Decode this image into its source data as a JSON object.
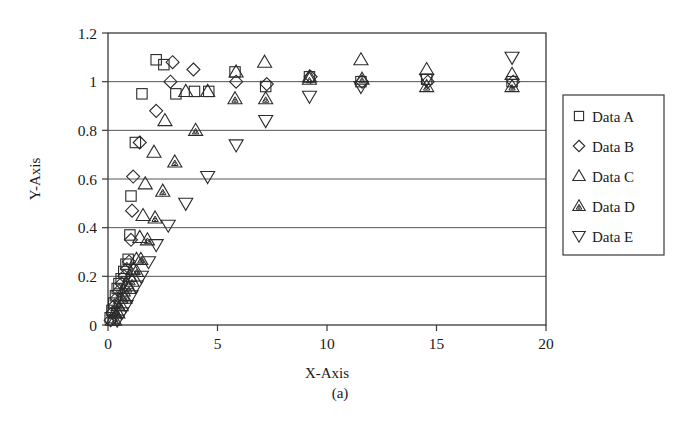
{
  "figure": {
    "caption": "(a)",
    "background_color": "#ffffff",
    "ink_color": "#2b2b2b"
  },
  "chart_data": {
    "type": "scatter",
    "title": "",
    "subtitle": "",
    "xlabel": "X-Axis",
    "ylabel": "Y-Axis",
    "xlim": [
      0,
      20
    ],
    "ylim": [
      0,
      1.2
    ],
    "xticks": [
      0,
      5,
      10,
      15,
      20
    ],
    "xtick_labels": [
      "0",
      "5",
      "10",
      "15",
      "20"
    ],
    "yticks": [
      0,
      0.2,
      0.4,
      0.6,
      0.8,
      1,
      1.2
    ],
    "ytick_labels": [
      "0",
      "0.2",
      "0.4",
      "0.6",
      "0.8",
      "1",
      "1.2"
    ],
    "grid": "horizontal",
    "legend_position": "right-outside",
    "legend_entries": [
      {
        "label": "Data A",
        "marker": "square"
      },
      {
        "label": "Data B",
        "marker": "diamond"
      },
      {
        "label": "Data C",
        "marker": "triangle-up"
      },
      {
        "label": "Data D",
        "marker": "triangle-up-hatched"
      },
      {
        "label": "Data E",
        "marker": "triangle-down"
      }
    ],
    "series": [
      {
        "name": "Data A",
        "marker": "square",
        "points": [
          [
            0.1,
            0.03
          ],
          [
            0.18,
            0.06
          ],
          [
            0.26,
            0.09
          ],
          [
            0.34,
            0.12
          ],
          [
            0.42,
            0.15
          ],
          [
            0.5,
            0.17
          ],
          [
            0.6,
            0.19
          ],
          [
            0.72,
            0.22
          ],
          [
            0.82,
            0.25
          ],
          [
            0.92,
            0.27
          ],
          [
            1.0,
            0.37
          ],
          [
            1.05,
            0.53
          ],
          [
            1.25,
            0.75
          ],
          [
            1.55,
            0.95
          ],
          [
            2.2,
            1.09
          ],
          [
            2.55,
            1.07
          ],
          [
            3.1,
            0.95
          ],
          [
            3.95,
            0.96
          ],
          [
            4.6,
            0.96
          ],
          [
            5.8,
            1.04
          ],
          [
            7.2,
            0.98
          ],
          [
            9.2,
            1.02
          ],
          [
            11.55,
            1.0
          ],
          [
            14.55,
            1.01
          ],
          [
            18.45,
            1.0
          ]
        ]
      },
      {
        "name": "Data B",
        "marker": "diamond",
        "points": [
          [
            0.12,
            0.02
          ],
          [
            0.2,
            0.05
          ],
          [
            0.3,
            0.08
          ],
          [
            0.4,
            0.11
          ],
          [
            0.5,
            0.14
          ],
          [
            0.62,
            0.17
          ],
          [
            0.74,
            0.2
          ],
          [
            0.86,
            0.23
          ],
          [
            0.96,
            0.26
          ],
          [
            1.05,
            0.35
          ],
          [
            1.1,
            0.47
          ],
          [
            1.15,
            0.61
          ],
          [
            1.45,
            0.75
          ],
          [
            2.2,
            0.88
          ],
          [
            2.85,
            1.0
          ],
          [
            2.95,
            1.08
          ],
          [
            3.9,
            1.05
          ],
          [
            5.85,
            1.0
          ],
          [
            7.25,
            0.99
          ],
          [
            9.25,
            1.02
          ],
          [
            11.6,
            1.0
          ],
          [
            14.6,
            1.0
          ],
          [
            18.5,
            1.0
          ]
        ]
      },
      {
        "name": "Data C",
        "marker": "triangle-up",
        "points": [
          [
            0.2,
            0.02
          ],
          [
            0.32,
            0.05
          ],
          [
            0.45,
            0.08
          ],
          [
            0.58,
            0.11
          ],
          [
            0.7,
            0.14
          ],
          [
            0.85,
            0.17
          ],
          [
            1.0,
            0.2
          ],
          [
            1.15,
            0.23
          ],
          [
            1.3,
            0.27
          ],
          [
            1.45,
            0.36
          ],
          [
            1.6,
            0.45
          ],
          [
            1.7,
            0.58
          ],
          [
            2.1,
            0.71
          ],
          [
            2.6,
            0.84
          ],
          [
            3.55,
            0.96
          ],
          [
            4.55,
            0.96
          ],
          [
            5.85,
            1.04
          ],
          [
            7.15,
            1.08
          ],
          [
            9.2,
            1.02
          ],
          [
            11.55,
            1.09
          ],
          [
            14.55,
            1.05
          ],
          [
            18.45,
            1.03
          ]
        ]
      },
      {
        "name": "Data D",
        "marker": "triangle-up-hatched",
        "points": [
          [
            0.3,
            0.02
          ],
          [
            0.45,
            0.05
          ],
          [
            0.6,
            0.08
          ],
          [
            0.78,
            0.11
          ],
          [
            0.95,
            0.15
          ],
          [
            1.1,
            0.18
          ],
          [
            1.3,
            0.22
          ],
          [
            1.5,
            0.27
          ],
          [
            1.8,
            0.35
          ],
          [
            2.15,
            0.44
          ],
          [
            2.5,
            0.55
          ],
          [
            3.05,
            0.67
          ],
          [
            4.0,
            0.8
          ],
          [
            5.8,
            0.93
          ],
          [
            7.2,
            0.93
          ],
          [
            9.2,
            1.01
          ],
          [
            11.6,
            1.01
          ],
          [
            14.55,
            0.98
          ],
          [
            18.45,
            0.98
          ]
        ]
      },
      {
        "name": "Data E",
        "marker": "triangle-down",
        "points": [
          [
            0.42,
            0.02
          ],
          [
            0.62,
            0.05
          ],
          [
            0.82,
            0.08
          ],
          [
            1.05,
            0.12
          ],
          [
            1.28,
            0.16
          ],
          [
            1.52,
            0.2
          ],
          [
            1.85,
            0.26
          ],
          [
            2.2,
            0.33
          ],
          [
            2.75,
            0.41
          ],
          [
            3.55,
            0.5
          ],
          [
            4.55,
            0.61
          ],
          [
            5.85,
            0.74
          ],
          [
            7.2,
            0.84
          ],
          [
            9.2,
            0.94
          ],
          [
            11.55,
            0.98
          ],
          [
            14.55,
            1.01
          ],
          [
            18.45,
            1.1
          ]
        ]
      }
    ]
  }
}
